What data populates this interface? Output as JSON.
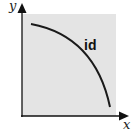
{
  "diagram": {
    "axes": {
      "x_label": "x",
      "y_label": "y"
    },
    "curve": {
      "label": "id",
      "shape": "concave-down decreasing arc from upper-left to lower-right"
    },
    "colors": {
      "background": "#ffffff",
      "plot_area": "#e4e4e4",
      "axis": "#111111",
      "curve": "#1a1a1a"
    }
  }
}
